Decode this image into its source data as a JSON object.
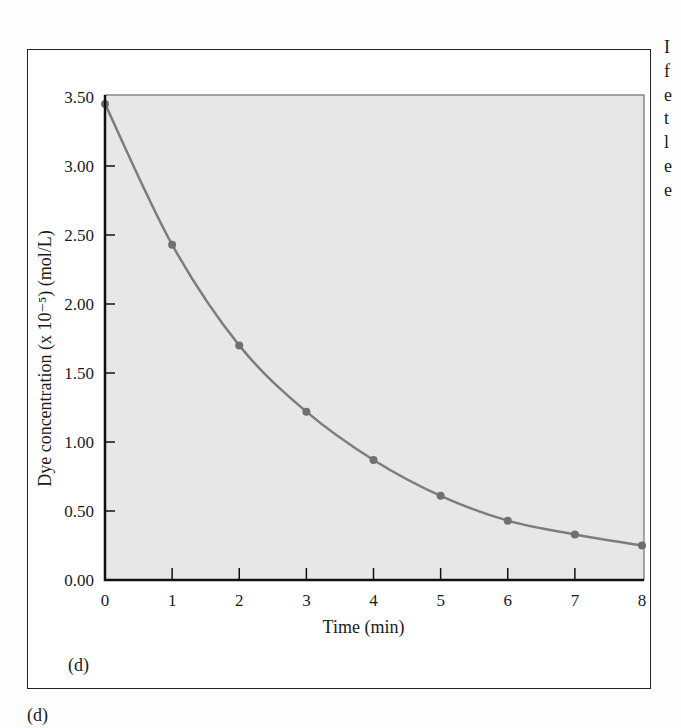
{
  "figure": {
    "panel_label_inner": "(d)",
    "panel_label_outer": "(d)",
    "cutoff_right_text": [
      "I",
      "f",
      "e",
      "t",
      "l",
      "e",
      "e"
    ]
  },
  "colors": {
    "plot_background": "#e7e7e7",
    "curve": "#7d7d7d",
    "marker": "#707070",
    "axis": "#111111"
  },
  "chart_data": {
    "type": "line",
    "title": "",
    "xlabel": "Time (min)",
    "ylabel": "Dye concentration (x 10⁻⁵) (mol/L)",
    "x": [
      0,
      1,
      2,
      3,
      4,
      5,
      6,
      7,
      8
    ],
    "series": [
      {
        "name": "Dye concentration",
        "values": [
          3.45,
          2.43,
          1.7,
          1.22,
          0.87,
          0.61,
          0.43,
          0.33,
          0.25
        ],
        "markers": true,
        "smooth": true
      }
    ],
    "xlim": [
      0,
      8
    ],
    "ylim": [
      0,
      3.5
    ],
    "x_ticks": [
      "0",
      "1",
      "2",
      "3",
      "4",
      "5",
      "6",
      "7",
      "8"
    ],
    "y_ticks": [
      "0.00",
      "0.50",
      "1.00",
      "1.50",
      "2.00",
      "2.50",
      "3.00",
      "3.50"
    ],
    "grid": false,
    "legend": null
  }
}
